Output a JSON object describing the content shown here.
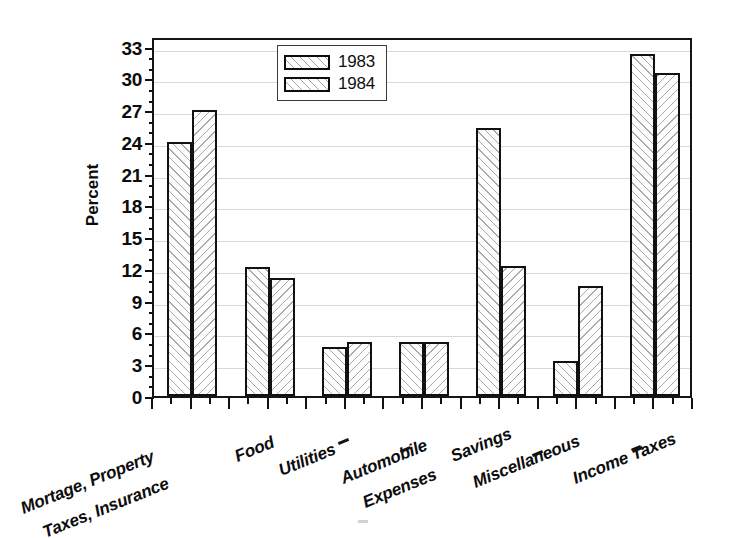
{
  "chart_data": {
    "type": "bar",
    "title": "",
    "xlabel": "",
    "ylabel": "Percent",
    "ylim": [
      0,
      34
    ],
    "yticks": [
      0,
      3,
      6,
      9,
      12,
      15,
      18,
      21,
      24,
      27,
      30,
      33
    ],
    "grid": true,
    "legend_position": "top-center",
    "categories": [
      "Mortage, Property Taxes, Insurance",
      "Food",
      "Utilities",
      "Automobile Expenses",
      "Savings",
      "Miscellaneous",
      "Income Taxes"
    ],
    "category_lines": [
      [
        "Mortage, Property",
        "Taxes, Insurance"
      ],
      [
        "Food"
      ],
      [
        "Utilities"
      ],
      [
        "Automobile",
        "Expenses"
      ],
      [
        "Savings"
      ],
      [
        "Miscellaneous"
      ],
      [
        "Income Taxes"
      ]
    ],
    "series": [
      {
        "name": "1983",
        "values": [
          24.0,
          12.2,
          4.6,
          5.1,
          25.3,
          3.3,
          32.3
        ]
      },
      {
        "name": "1984",
        "values": [
          27.0,
          11.1,
          5.1,
          5.1,
          12.3,
          10.4,
          30.5
        ]
      }
    ]
  },
  "legend": {
    "items": [
      {
        "label": "1983"
      },
      {
        "label": "1984"
      }
    ]
  },
  "axes": {
    "y_title": "Percent",
    "y_tick_labels": [
      "33",
      "30",
      "27",
      "24",
      "21",
      "18",
      "15",
      "12",
      "9",
      "6",
      "3",
      "0"
    ]
  },
  "colors": {
    "ink": "#111111",
    "gridline": "#d7d7dd",
    "background": "#ffffff"
  }
}
